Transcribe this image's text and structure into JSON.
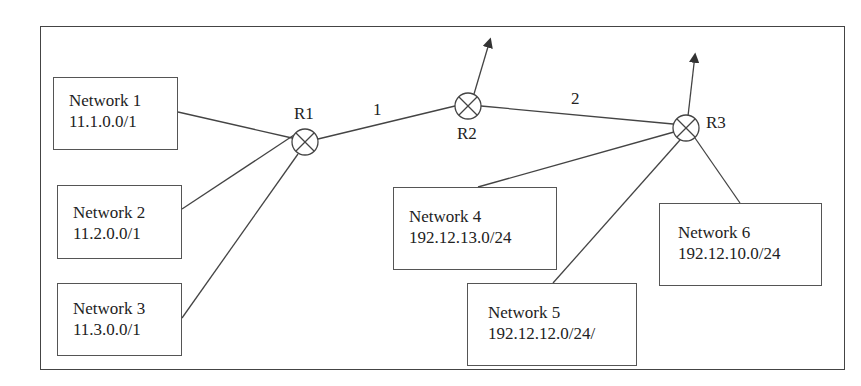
{
  "fragments": {
    "top_text": "",
    "bottom_caption": ""
  },
  "diagram": {
    "routers": [
      {
        "id": "R1",
        "label": "R1"
      },
      {
        "id": "R2",
        "label": "R2"
      },
      {
        "id": "R3",
        "label": "R3"
      }
    ],
    "links": [
      {
        "label": "1",
        "from": "R1",
        "to": "R2"
      },
      {
        "label": "2",
        "from": "R2",
        "to": "R3"
      }
    ],
    "networks": [
      {
        "name": "Network 1",
        "prefix": "11.1.0.0/1",
        "router": "R1"
      },
      {
        "name": "Network 2",
        "prefix": "11.2.0.0/1",
        "router": "R1"
      },
      {
        "name": "Network 3",
        "prefix": "11.3.0.0/1",
        "router": "R1"
      },
      {
        "name": "Network 4",
        "prefix": "192.12.13.0/24",
        "router": "R3"
      },
      {
        "name": "Network 5",
        "prefix": "192.12.12.0/24/",
        "router": "R3"
      },
      {
        "name": "Network 6",
        "prefix": "192.12.10.0/24",
        "router": "R3"
      }
    ],
    "external_arrows": [
      "R2",
      "R3"
    ],
    "colors": {
      "line": "#444444",
      "background": "#ffffff"
    }
  }
}
